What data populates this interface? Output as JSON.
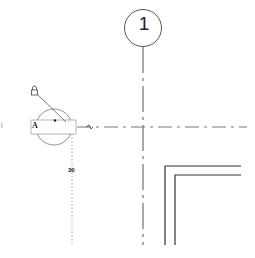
{
  "drawing": {
    "grid_bubble": {
      "label": "1"
    },
    "elevation_tag": {
      "label": "A"
    },
    "temporary_dimension": {
      "value": "30"
    },
    "edge_mark": "|",
    "colors": {
      "background": "#ffffff",
      "line": "#333333",
      "grid_line": "#555555",
      "tag_circle": "#777777",
      "dimension": "#999999"
    }
  }
}
